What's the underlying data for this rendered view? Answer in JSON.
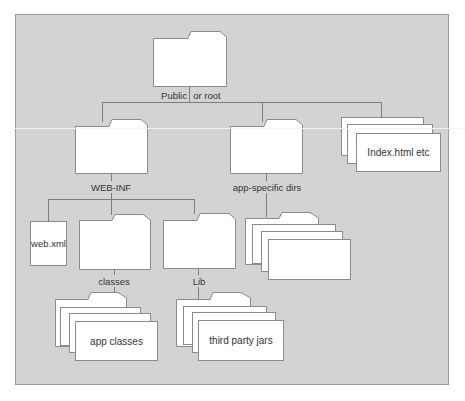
{
  "diagram": {
    "colors": {
      "background": "#d3d3d3",
      "line": "#7c7c7c",
      "node_fill": "#ffffff",
      "node_border": "#8a8a8a",
      "text": "#333333"
    },
    "nodes": {
      "root": {
        "label_left": "Public",
        "label_right": "or root",
        "type": "folder"
      },
      "web_inf": {
        "label": "WEB-INF",
        "type": "folder"
      },
      "app_specific": {
        "label": "app-specific dirs",
        "type": "folder-stack"
      },
      "index_files": {
        "label": "Index.html etc",
        "type": "file-stack"
      },
      "web_xml": {
        "label": "web.xml",
        "type": "file"
      },
      "classes": {
        "label": "classes",
        "type": "folder"
      },
      "lib": {
        "label": "Lib",
        "type": "folder"
      },
      "app_classes": {
        "label": "app classes",
        "type": "folder-stack"
      },
      "third_party": {
        "label": "third party jars",
        "type": "folder-stack"
      }
    },
    "edges": [
      [
        "root",
        "web_inf"
      ],
      [
        "root",
        "app_specific"
      ],
      [
        "root",
        "index_files"
      ],
      [
        "web_inf",
        "web_xml"
      ],
      [
        "web_inf",
        "classes"
      ],
      [
        "web_inf",
        "lib"
      ],
      [
        "app_specific",
        "app_specific_stack"
      ],
      [
        "classes",
        "app_classes"
      ],
      [
        "lib",
        "third_party"
      ]
    ]
  }
}
